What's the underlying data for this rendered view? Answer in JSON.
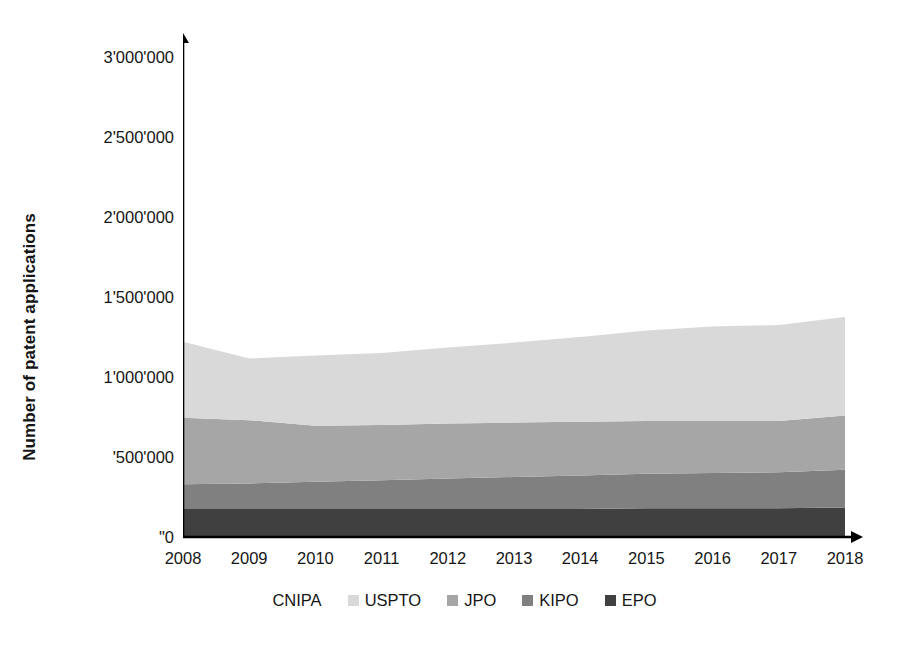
{
  "chart_data": {
    "type": "area",
    "stacked": true,
    "title": "",
    "subtitle": "",
    "xlabel": "",
    "ylabel": "Number of patent applications",
    "x": [
      2008,
      2009,
      2010,
      2011,
      2012,
      2013,
      2014,
      2015,
      2016,
      2017,
      2018
    ],
    "categories": [
      "2008",
      "2009",
      "2010",
      "2011",
      "2012",
      "2013",
      "2014",
      "2015",
      "2016",
      "2017",
      "2018"
    ],
    "ylim": [
      0,
      3000000
    ],
    "xlim": [
      2008,
      2018
    ],
    "y_ticks": [
      0,
      500000,
      1000000,
      1500000,
      2000000,
      2500000,
      3000000
    ],
    "y_tick_labels": [
      "\"0",
      "'500'000",
      "1'000'000",
      "1'500'000",
      "2'000'000",
      "2'500'000",
      "3'000'000"
    ],
    "grid": false,
    "legend_position": "bottom",
    "stack_order_bottom_to_top": [
      "EPO",
      "KIPO",
      "JPO",
      "USPTO",
      "CNIPA"
    ],
    "series": [
      {
        "name": "CNIPA",
        "color": "#ffffff",
        "values": [
          0,
          0,
          0,
          0,
          0,
          0,
          0,
          0,
          0,
          0,
          0
        ]
      },
      {
        "name": "USPTO",
        "color": "#d9d9d9",
        "values": [
          475000,
          385000,
          440000,
          450000,
          475000,
          500000,
          530000,
          565000,
          590000,
          600000,
          615000
        ]
      },
      {
        "name": "JPO",
        "color": "#a6a6a6",
        "values": [
          415000,
          395000,
          350000,
          345000,
          345000,
          340000,
          335000,
          330000,
          325000,
          320000,
          340000
        ]
      },
      {
        "name": "KIPO",
        "color": "#808080",
        "values": [
          155000,
          160000,
          170000,
          180000,
          190000,
          200000,
          210000,
          215000,
          220000,
          225000,
          235000
        ]
      },
      {
        "name": "EPO",
        "color": "#404040",
        "values": [
          175000,
          175000,
          175000,
          175000,
          175000,
          175000,
          175000,
          180000,
          180000,
          180000,
          185000
        ]
      }
    ],
    "cumulative_totals": [
      1220000,
      1115000,
      1135000,
      1150000,
      1185000,
      1215000,
      1250000,
      1290000,
      1315000,
      1325000,
      1375000
    ]
  },
  "axes": {
    "y_title": "Number of patent applications",
    "y_tick_labels": [
      "3'000'000",
      "2'500'000",
      "2'000'000",
      "1'500'000",
      "1'000'000",
      "'500'000",
      "\"0"
    ],
    "x_tick_labels": [
      "2008",
      "2009",
      "2010",
      "2011",
      "2012",
      "2013",
      "2014",
      "2015",
      "2016",
      "2017",
      "2018"
    ],
    "axis_color": "#000000"
  },
  "legend": {
    "items": [
      {
        "label": "CNIPA",
        "color": "#ffffff"
      },
      {
        "label": "USPTO",
        "color": "#d9d9d9"
      },
      {
        "label": "JPO",
        "color": "#a6a6a6"
      },
      {
        "label": "KIPO",
        "color": "#808080"
      },
      {
        "label": "EPO",
        "color": "#404040"
      }
    ]
  }
}
